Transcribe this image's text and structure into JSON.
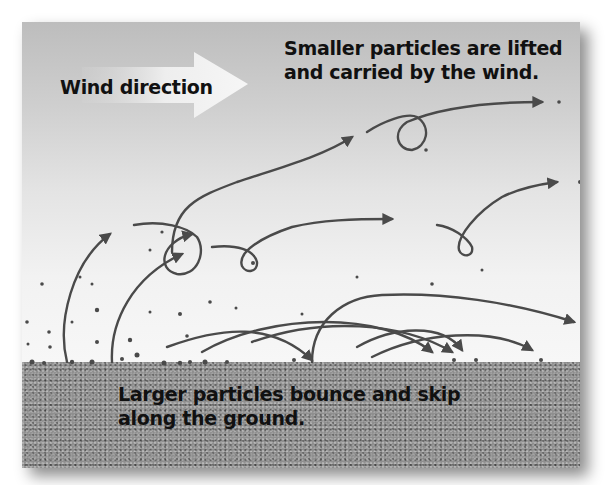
{
  "figure": {
    "labels": {
      "wind_direction": "Wind direction",
      "small_particles": [
        "Smaller particles are lifted",
        "and carried by the wind."
      ],
      "large_particles": [
        "Larger particles bounce and skip",
        "along the ground."
      ]
    },
    "icons": {
      "wind_arrow": "wide-right-arrow",
      "trajectory": "curved-arrow",
      "particle": "dot"
    },
    "colors": {
      "sky_top": "#bdbdbd",
      "sky_bottom": "#f7f7f7",
      "ground": "#8f8f8f",
      "trajectory": "#4a4a4a",
      "wind_arrow_fill": "#f2f2f2",
      "text": "#111111"
    }
  }
}
